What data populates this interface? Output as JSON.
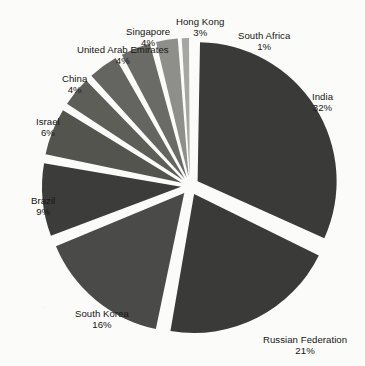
{
  "chart_data": {
    "type": "pie",
    "title": "",
    "subtitle": "",
    "xlabel": "",
    "ylabel": "",
    "legend_position": "none",
    "grid": false,
    "exploded": true,
    "value_unit": "percent",
    "categories": [
      "India",
      "Russian Federation",
      "South Korea",
      "Brazil",
      "Israel",
      "China",
      "United Arab Emirates",
      "Singapore",
      "Hong Kong",
      "South Africa"
    ],
    "values": [
      32,
      21,
      16,
      9,
      6,
      4,
      4,
      4,
      3,
      1
    ],
    "labels": [
      "India\n32%",
      "Russian Federation\n21%",
      "South Korea\n16%",
      "Brazil\n9%",
      "Israel\n6%",
      "China\n4%",
      "United Arab Emirates\n4%",
      "Singapore\n4%",
      "Hong Kong\n3%",
      "South Africa\n1%"
    ],
    "slices": [
      {
        "name": "India",
        "value": 32,
        "pct_text": "32%",
        "color": "#3a3a38"
      },
      {
        "name": "Russian Federation",
        "value": 21,
        "pct_text": "21%",
        "color": "#3a3a38"
      },
      {
        "name": "South Korea",
        "value": 16,
        "pct_text": "16%",
        "color": "#4a4a48"
      },
      {
        "name": "Brazil",
        "value": 9,
        "pct_text": "9%",
        "color": "#3c3c3a"
      },
      {
        "name": "Israel",
        "value": 6,
        "pct_text": "6%",
        "color": "#54544f"
      },
      {
        "name": "China",
        "value": 4,
        "pct_text": "4%",
        "color": "#5e5e59"
      },
      {
        "name": "United Arab Emirates",
        "value": 4,
        "pct_text": "4%",
        "color": "#646460"
      },
      {
        "name": "Singapore",
        "value": 4,
        "pct_text": "4%",
        "color": "#6a6a66"
      },
      {
        "name": "Hong Kong",
        "value": 3,
        "pct_text": "3%",
        "color": "#8e8e8a"
      },
      {
        "name": "South Africa",
        "value": 1,
        "pct_text": "1%",
        "color": "#a6a6a2"
      }
    ],
    "background_color": "#fbfbf9",
    "label_color": "#161614"
  },
  "labels": {
    "india": {
      "name": "India",
      "pct": "32%"
    },
    "russia": {
      "name": "Russian Federation",
      "pct": "21%"
    },
    "south_korea": {
      "name": "South Korea",
      "pct": "16%"
    },
    "brazil": {
      "name": "Brazil",
      "pct": "9%"
    },
    "israel": {
      "name": "Israel",
      "pct": "6%"
    },
    "china": {
      "name": "China",
      "pct": "4%"
    },
    "uae": {
      "name": "United Arab Emirates",
      "pct": "4%"
    },
    "singapore": {
      "name": "Singapore",
      "pct": "4%"
    },
    "hong_kong": {
      "name": "Hong Kong",
      "pct": "3%"
    },
    "south_africa": {
      "name": "South Africa",
      "pct": "1%"
    }
  }
}
